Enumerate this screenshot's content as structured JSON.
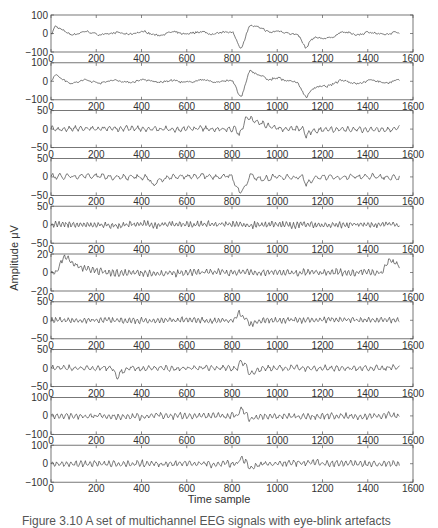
{
  "figure": {
    "ylabel": "Amplitude μV",
    "xlabel": "Time sample",
    "caption": "Figure 3.10  A set of multichannel EEG signals with eye-blink artefacts"
  },
  "chart_data": {
    "type": "line",
    "title": "",
    "xlabel": "Time sample",
    "ylabel": "Amplitude μV",
    "xlim": [
      0,
      1600
    ],
    "xticks": [
      0,
      200,
      400,
      600,
      800,
      1000,
      1200,
      1400,
      1600
    ],
    "grid": false,
    "legend": "none",
    "n_samples": 1540,
    "annotations": "Eye-blink artefacts near samples ~850 and ~1130",
    "channels": [
      {
        "name": "ch1",
        "ylim": [
          -100,
          100
        ],
        "yticks": [
          -100,
          0,
          100
        ],
        "character": "large slow artefact",
        "events": [
          {
            "x": 20,
            "y": 35
          },
          {
            "x": 840,
            "y": -70
          },
          {
            "x": 880,
            "y": 80
          },
          {
            "x": 1130,
            "y": -80
          },
          {
            "x": 1150,
            "y": 15
          }
        ],
        "noise": 6,
        "freq": 0.05
      },
      {
        "name": "ch2",
        "ylim": [
          -100,
          100
        ],
        "yticks": [
          -100,
          0,
          100
        ],
        "character": "large slow artefact",
        "events": [
          {
            "x": 20,
            "y": 35
          },
          {
            "x": 840,
            "y": -80
          },
          {
            "x": 880,
            "y": 95
          },
          {
            "x": 1130,
            "y": -85
          },
          {
            "x": 1150,
            "y": 12
          }
        ],
        "noise": 6,
        "freq": 0.05
      },
      {
        "name": "ch3",
        "ylim": [
          -50,
          50
        ],
        "yticks": [
          -50,
          0,
          50
        ],
        "character": "medium artefact",
        "events": [
          {
            "x": 835,
            "y": -20
          },
          {
            "x": 870,
            "y": 40
          },
          {
            "x": 1130,
            "y": -18
          }
        ],
        "noise": 9,
        "freq": 0.25
      },
      {
        "name": "ch4",
        "ylim": [
          -50,
          50
        ],
        "yticks": [
          -50,
          0,
          50
        ],
        "character": "medium artefact",
        "events": [
          {
            "x": 450,
            "y": -20
          },
          {
            "x": 835,
            "y": -40
          },
          {
            "x": 880,
            "y": 25
          },
          {
            "x": 1130,
            "y": -20
          }
        ],
        "noise": 9,
        "freq": 0.2
      },
      {
        "name": "ch5",
        "ylim": [
          -50,
          50
        ],
        "yticks": [
          -50,
          0,
          50
        ],
        "character": "oscillatory",
        "events": [],
        "noise": 10,
        "freq": 0.4
      },
      {
        "name": "ch6",
        "ylim": [
          -20,
          20
        ],
        "yticks": [
          -20,
          0,
          20
        ],
        "character": "high-amplitude oscillatory",
        "events": [
          {
            "x": 60,
            "y": 18
          },
          {
            "x": 1500,
            "y": 14
          }
        ],
        "noise": 11,
        "freq": 0.35
      },
      {
        "name": "ch7",
        "ylim": [
          -50,
          50
        ],
        "yticks": [
          -50,
          0,
          50
        ],
        "character": "oscillatory, small blink",
        "events": [
          {
            "x": 830,
            "y": 20
          },
          {
            "x": 880,
            "y": -15
          }
        ],
        "noise": 9,
        "freq": 0.35
      },
      {
        "name": "ch8",
        "ylim": [
          -50,
          50
        ],
        "yticks": [
          -50,
          0,
          50
        ],
        "character": "blink dip",
        "events": [
          {
            "x": 290,
            "y": -25
          },
          {
            "x": 840,
            "y": 20
          },
          {
            "x": 880,
            "y": -25
          }
        ],
        "noise": 9,
        "freq": 0.25
      },
      {
        "name": "ch9",
        "ylim": [
          -100,
          100
        ],
        "yticks": [
          -100,
          0,
          100
        ],
        "character": "blink dip",
        "events": [
          {
            "x": 840,
            "y": 35
          },
          {
            "x": 880,
            "y": -25
          }
        ],
        "noise": 10,
        "freq": 0.3
      },
      {
        "name": "ch10",
        "ylim": [
          -100,
          100
        ],
        "yticks": [
          -100,
          0,
          100
        ],
        "character": "blink dip",
        "events": [
          {
            "x": 840,
            "y": 35
          },
          {
            "x": 880,
            "y": -35
          }
        ],
        "noise": 10,
        "freq": 0.3
      }
    ]
  }
}
